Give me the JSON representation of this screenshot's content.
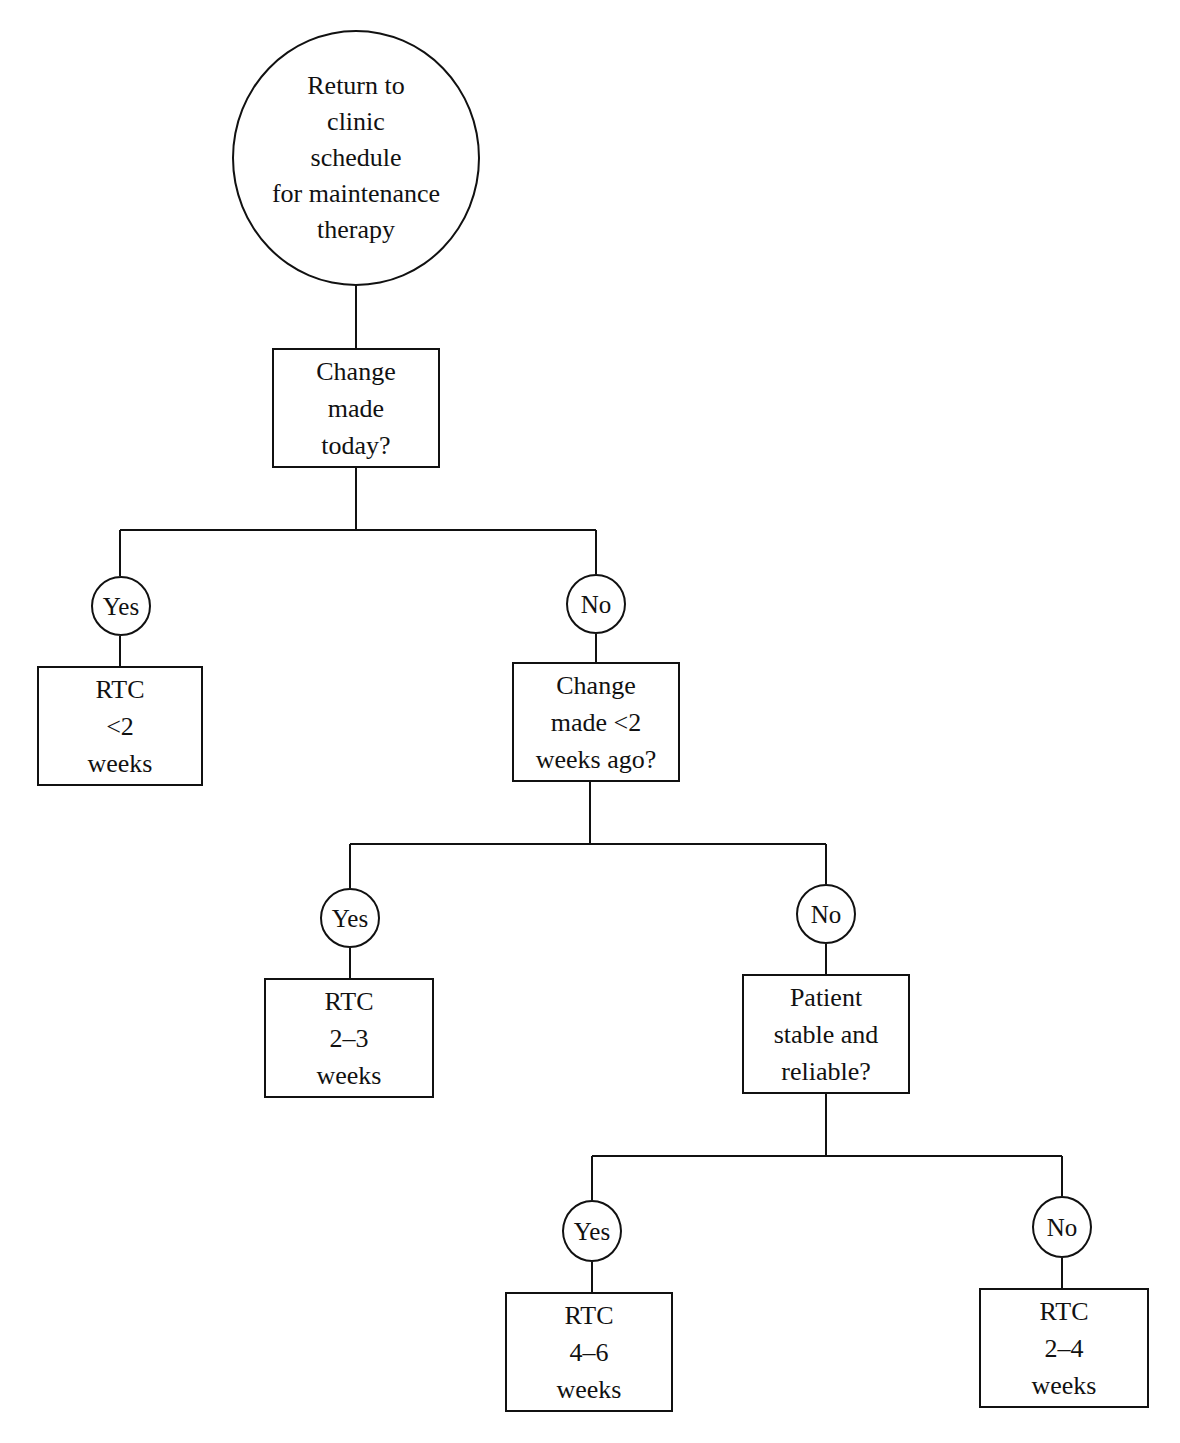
{
  "diagram": {
    "type": "decision-tree",
    "root": {
      "shape": "circle",
      "lines": [
        "Return to",
        "clinic",
        "schedule",
        "for maintenance",
        "therapy"
      ]
    },
    "decision1": {
      "lines": [
        "Change",
        "made",
        "today?"
      ]
    },
    "d1_yes_label": "Yes",
    "d1_no_label": "No",
    "d1_yes_outcome": {
      "lines": [
        "RTC",
        "<2",
        "weeks"
      ]
    },
    "decision2": {
      "lines": [
        "Change",
        "made <2",
        "weeks ago?"
      ]
    },
    "d2_yes_label": "Yes",
    "d2_no_label": "No",
    "d2_yes_outcome": {
      "lines": [
        "RTC",
        "2–3",
        "weeks"
      ]
    },
    "decision3": {
      "lines": [
        "Patient",
        "stable and",
        "reliable?"
      ]
    },
    "d3_yes_label": "Yes",
    "d3_no_label": "No",
    "d3_yes_outcome": {
      "lines": [
        "RTC",
        "4–6",
        "weeks"
      ]
    },
    "d3_no_outcome": {
      "lines": [
        "RTC",
        "2–4",
        "weeks"
      ]
    }
  }
}
